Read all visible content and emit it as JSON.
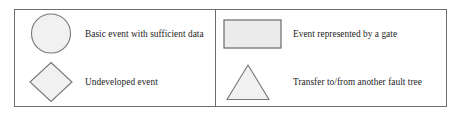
{
  "diagram": {
    "frame_border_color": "#6e6e6e",
    "shape_fill_color": "#f1f1f1",
    "shape_stroke_color": "#777777",
    "text_color": "#1d1d1d",
    "columns": [
      {
        "id": "left",
        "entries": [
          {
            "symbol": "circle",
            "symbol_name": "basic-event-circle-symbol",
            "label": "Basic event with sufficient data"
          },
          {
            "symbol": "diamond",
            "symbol_name": "undeveloped-event-diamond-symbol",
            "label": "Undeveloped event"
          }
        ]
      },
      {
        "id": "right",
        "entries": [
          {
            "symbol": "rectangle",
            "symbol_name": "gate-event-rectangle-symbol",
            "label": "Event represented by a gate"
          },
          {
            "symbol": "triangle",
            "symbol_name": "transfer-triangle-symbol",
            "label": "Transfer to/from another fault tree"
          }
        ]
      }
    ]
  }
}
